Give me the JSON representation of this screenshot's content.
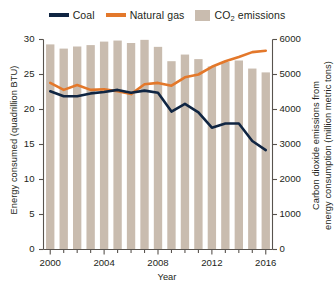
{
  "legend": {
    "items": [
      {
        "label": "Coal",
        "type": "line",
        "color": "#102542",
        "name": "legend-coal"
      },
      {
        "label": "Natural gas",
        "type": "line",
        "color": "#E3782B",
        "name": "legend-natural-gas"
      },
      {
        "label": "CO2 emissions",
        "label_main": "CO",
        "label_sub": "2",
        "label_tail": " emissions",
        "type": "bar",
        "color": "#C9BCAF",
        "name": "legend-co2-emissions"
      }
    ]
  },
  "axes": {
    "x": {
      "label": "Year",
      "ticks": [
        2000,
        2001,
        2002,
        2003,
        2004,
        2005,
        2006,
        2007,
        2008,
        2009,
        2010,
        2011,
        2012,
        2013,
        2014,
        2015,
        2016
      ],
      "labeled_ticks": [
        "2000",
        "2004",
        "2008",
        "2012",
        "2016"
      ],
      "range": [
        1999.5,
        2016.5
      ]
    },
    "y_left": {
      "label": "Energy consumed (quadrillion BTU)",
      "ticks": [
        "0",
        "5",
        "10",
        "15",
        "20",
        "25",
        "30"
      ],
      "range": [
        0,
        30
      ]
    },
    "y_right": {
      "label": "Carbon dioxide emissions from energy consumption (million metric tons)",
      "label_line1": "Carbon dioxide emissions from",
      "label_line2": "energy consumption (million metric tons)",
      "ticks": [
        "0",
        "1000",
        "2000",
        "3000",
        "4000",
        "5000",
        "6000"
      ],
      "range": [
        0,
        6000
      ]
    }
  },
  "colors": {
    "coal": "#102542",
    "natural_gas": "#E3782B",
    "bars": "#C9BCAF",
    "axis": "#58534E",
    "text": "#231f20",
    "background": "#ffffff"
  },
  "chart_data": {
    "type": "bar",
    "title": "",
    "xlabel": "Year",
    "ylabel": "Energy consumed (quadrillion BTU)",
    "ylabel_secondary": "Carbon dioxide emissions from energy consumption (million metric tons)",
    "grid": false,
    "legend_position": "top",
    "x": [
      2000,
      2001,
      2002,
      2003,
      2004,
      2005,
      2006,
      2007,
      2008,
      2009,
      2010,
      2011,
      2012,
      2013,
      2014,
      2015,
      2016
    ],
    "categories": [
      "2000",
      "2001",
      "2002",
      "2003",
      "2004",
      "2005",
      "2006",
      "2007",
      "2008",
      "2009",
      "2010",
      "2011",
      "2012",
      "2013",
      "2014",
      "2015",
      "2016"
    ],
    "ylim": [
      0,
      30
    ],
    "ylim_secondary": [
      0,
      6000
    ],
    "series": [
      {
        "name": "CO2 emissions",
        "type": "bar",
        "axis": "right",
        "unit": "million metric tons",
        "color": "#C9BCAF",
        "values": [
          5860,
          5740,
          5800,
          5840,
          5940,
          5970,
          5900,
          5990,
          5790,
          5380,
          5570,
          5440,
          5230,
          5360,
          5400,
          5170,
          5060
        ]
      },
      {
        "name": "Coal",
        "type": "line",
        "axis": "left",
        "unit": "quadrillion BTU",
        "color": "#102542",
        "values": [
          22.6,
          21.9,
          21.9,
          22.3,
          22.5,
          22.8,
          22.4,
          22.7,
          22.4,
          19.7,
          20.8,
          19.6,
          17.4,
          18.0,
          18.0,
          15.5,
          14.2
        ]
      },
      {
        "name": "Natural gas",
        "type": "line",
        "axis": "left",
        "unit": "quadrillion BTU",
        "color": "#E3782B",
        "values": [
          23.8,
          22.8,
          23.5,
          22.8,
          22.9,
          22.6,
          22.2,
          23.6,
          23.8,
          23.4,
          24.6,
          25.0,
          26.1,
          26.9,
          27.5,
          28.2,
          28.4
        ]
      }
    ]
  }
}
